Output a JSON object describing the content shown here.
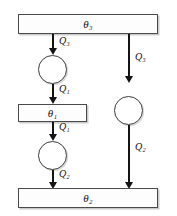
{
  "diagram": {
    "type": "flow-diagram",
    "title": "",
    "nodes": [
      {
        "id": "theta3",
        "shape": "rectangle",
        "symbol": "θ",
        "subscript": "3",
        "label": "θ₃"
      },
      {
        "id": "theta1",
        "shape": "rectangle",
        "symbol": "θ",
        "subscript": "1",
        "label": "θ₁"
      },
      {
        "id": "theta2",
        "shape": "rectangle",
        "symbol": "θ",
        "subscript": "2",
        "label": "θ₂"
      },
      {
        "id": "circle-left-upper",
        "shape": "circle",
        "label": ""
      },
      {
        "id": "circle-left-lower",
        "shape": "circle",
        "label": ""
      },
      {
        "id": "circle-right",
        "shape": "circle",
        "label": ""
      }
    ],
    "flows": [
      {
        "id": "flow-left-1",
        "symbol": "Q",
        "subscript": "3",
        "label": "Q₃",
        "from": "theta3",
        "to": "circle-left-upper"
      },
      {
        "id": "flow-left-2",
        "symbol": "Q",
        "subscript": "1",
        "label": "Q₁",
        "from": "circle-left-upper",
        "to": "theta1"
      },
      {
        "id": "flow-left-3",
        "symbol": "Q",
        "subscript": "1",
        "label": "Q₁",
        "from": "theta1",
        "to": "circle-left-lower"
      },
      {
        "id": "flow-left-4",
        "symbol": "Q",
        "subscript": "2",
        "label": "Q₂",
        "from": "circle-left-lower",
        "to": "theta2"
      },
      {
        "id": "flow-right-1",
        "symbol": "Q",
        "subscript": "3",
        "label": "Q₃",
        "from": "theta3",
        "to": "circle-right"
      },
      {
        "id": "flow-right-2",
        "symbol": "Q",
        "subscript": "2",
        "label": "Q₂",
        "from": "circle-right",
        "to": "theta2"
      }
    ]
  }
}
